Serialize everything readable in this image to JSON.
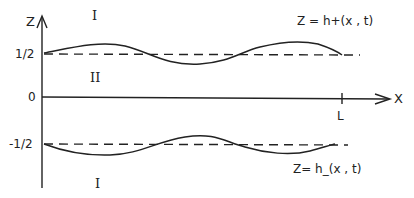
{
  "diagram": {
    "axes": {
      "vertical_label": "Z",
      "horizontal_label": "X",
      "ticks_vertical": [
        "1/2",
        "0",
        "-1/2"
      ],
      "tick_horizontal": "L"
    },
    "regions": {
      "upper": "I",
      "middle": "II",
      "lower": "I"
    },
    "interfaces": {
      "upper": "Z = h+(x , t)",
      "lower": "Z= h_(x , t)"
    },
    "colors": {
      "ink": "#222222",
      "background": "#ffffff"
    }
  }
}
